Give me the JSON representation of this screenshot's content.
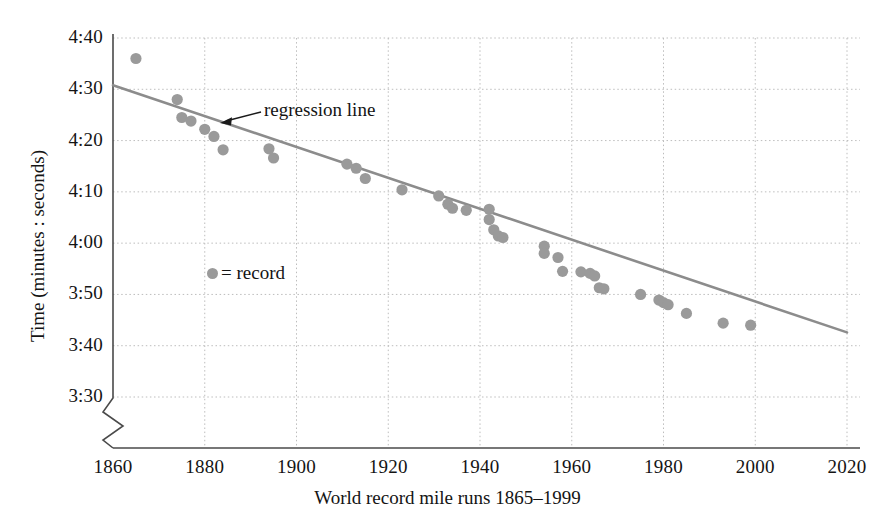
{
  "chart_data": {
    "type": "scatter",
    "title": "",
    "xlabel": "World record mile runs 1865–1999",
    "ylabel": "Time (minutes : seconds)",
    "xlim": [
      1860,
      2020
    ],
    "ylim_seconds": [
      210,
      280
    ],
    "ylim_labels": [
      "3:30",
      "4:40"
    ],
    "grid": true,
    "axis_break": true,
    "axis_break_note": "y-axis broken below 3:30",
    "xticks": [
      1860,
      1880,
      1900,
      1920,
      1940,
      1960,
      1980,
      2000,
      2020
    ],
    "xtick_labels": [
      "1860",
      "1880",
      "1900",
      "1920",
      "1940",
      "1960",
      "1980",
      "2000",
      "2020"
    ],
    "yticks_seconds": [
      210,
      220,
      230,
      240,
      250,
      260,
      270,
      280
    ],
    "ytick_labels": [
      "3:30",
      "3:40",
      "3:50",
      "4:00",
      "4:10",
      "4:20",
      "4:30",
      "4:40"
    ],
    "legend": {
      "position": "inside-left",
      "entries": [
        {
          "marker": "circle",
          "label": "= record",
          "color": "#9a9a9a"
        }
      ]
    },
    "annotations": [
      {
        "text": "regression line",
        "points_to_series": "regression",
        "x": 1903,
        "y_seconds": 263
      }
    ],
    "series": [
      {
        "name": "record",
        "type": "scatter",
        "marker": "circle",
        "color": "#9a9a9a",
        "points": [
          {
            "x": 1865,
            "y_label": "4:36",
            "y_seconds": 276.0
          },
          {
            "x": 1874,
            "y_label": "4:28",
            "y_seconds": 268.0
          },
          {
            "x": 1875,
            "y_label": "4:24",
            "y_seconds": 264.5
          },
          {
            "x": 1877,
            "y_label": "4:24",
            "y_seconds": 263.8
          },
          {
            "x": 1880,
            "y_label": "4:22",
            "y_seconds": 262.2
          },
          {
            "x": 1882,
            "y_label": "4:21",
            "y_seconds": 260.8
          },
          {
            "x": 1884,
            "y_label": "4:18",
            "y_seconds": 258.2
          },
          {
            "x": 1894,
            "y_label": "4:18",
            "y_seconds": 258.4
          },
          {
            "x": 1895,
            "y_label": "4:17",
            "y_seconds": 256.6
          },
          {
            "x": 1911,
            "y_label": "4:15",
            "y_seconds": 255.4
          },
          {
            "x": 1913,
            "y_label": "4:14",
            "y_seconds": 254.6
          },
          {
            "x": 1915,
            "y_label": "4:12",
            "y_seconds": 252.6
          },
          {
            "x": 1923,
            "y_label": "4:10",
            "y_seconds": 250.4
          },
          {
            "x": 1931,
            "y_label": "4:09",
            "y_seconds": 249.2
          },
          {
            "x": 1933,
            "y_label": "4:07",
            "y_seconds": 247.6
          },
          {
            "x": 1934,
            "y_label": "4:06",
            "y_seconds": 246.8
          },
          {
            "x": 1937,
            "y_label": "4:06",
            "y_seconds": 246.4
          },
          {
            "x": 1942,
            "y_label": "4:06",
            "y_seconds": 246.6
          },
          {
            "x": 1942,
            "y_label": "4:04",
            "y_seconds": 244.6
          },
          {
            "x": 1943,
            "y_label": "4:02",
            "y_seconds": 242.6
          },
          {
            "x": 1944,
            "y_label": "4:01",
            "y_seconds": 241.4
          },
          {
            "x": 1945,
            "y_label": "4:01",
            "y_seconds": 241.1
          },
          {
            "x": 1954,
            "y_label": "3:59",
            "y_seconds": 239.4
          },
          {
            "x": 1954,
            "y_label": "3:58",
            "y_seconds": 238.0
          },
          {
            "x": 1957,
            "y_label": "3:57",
            "y_seconds": 237.2
          },
          {
            "x": 1958,
            "y_label": "3:54",
            "y_seconds": 234.5
          },
          {
            "x": 1962,
            "y_label": "3:54",
            "y_seconds": 234.4
          },
          {
            "x": 1964,
            "y_label": "3:54",
            "y_seconds": 234.1
          },
          {
            "x": 1965,
            "y_label": "3:53",
            "y_seconds": 233.6
          },
          {
            "x": 1966,
            "y_label": "3:51",
            "y_seconds": 231.3
          },
          {
            "x": 1967,
            "y_label": "3:51",
            "y_seconds": 231.1
          },
          {
            "x": 1975,
            "y_label": "3:50",
            "y_seconds": 230.0
          },
          {
            "x": 1979,
            "y_label": "3:49",
            "y_seconds": 228.9
          },
          {
            "x": 1980,
            "y_label": "3:48",
            "y_seconds": 228.4
          },
          {
            "x": 1981,
            "y_label": "3:48",
            "y_seconds": 228.0
          },
          {
            "x": 1985,
            "y_label": "3:46",
            "y_seconds": 226.3
          },
          {
            "x": 1993,
            "y_label": "3:44",
            "y_seconds": 224.4
          },
          {
            "x": 1999,
            "y_label": "3:43",
            "y_seconds": 224.0
          }
        ]
      },
      {
        "name": "regression",
        "type": "line",
        "color": "#8c8c8c",
        "label": "regression line",
        "endpoints": [
          {
            "x": 1860,
            "y_seconds": 270.8
          },
          {
            "x": 2020,
            "y_seconds": 222.6
          }
        ]
      }
    ]
  }
}
